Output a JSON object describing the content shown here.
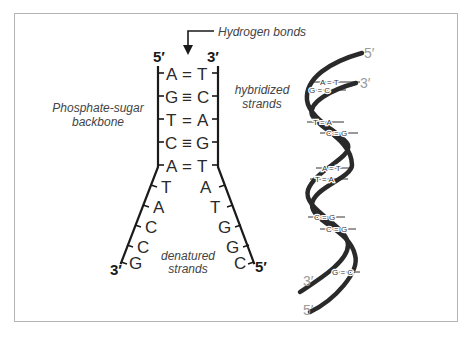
{
  "labels": {
    "hydrogen_bonds": "Hydrogen bonds",
    "hybridized_line1": "hybridized",
    "hybridized_line2": "strands",
    "backbone_line1": "Phosphate-sugar",
    "backbone_line2": "backbone",
    "denatured_line1": "denatured",
    "denatured_line2": "strands"
  },
  "ladder": {
    "top_left_prime": "5′",
    "top_right_prime": "3′",
    "bottom_left_prime": "3′",
    "bottom_right_prime": "5′",
    "hybridized_pairs": [
      {
        "left": "A",
        "bond": "=",
        "right": "T"
      },
      {
        "left": "G",
        "bond": "≡",
        "right": "C"
      },
      {
        "left": "T",
        "bond": "=",
        "right": "A"
      },
      {
        "left": "C",
        "bond": "≡",
        "right": "G"
      },
      {
        "left": "A",
        "bond": "=",
        "right": "T"
      }
    ],
    "denatured_left": [
      "T",
      "A",
      "C",
      "C",
      "G"
    ],
    "denatured_right": [
      "A",
      "T",
      "G",
      "G",
      "C"
    ]
  },
  "helix": {
    "top_5prime": "5′",
    "top_3prime": "3′",
    "bottom_3prime": "3′",
    "bottom_5prime": "5′",
    "pairs": [
      "A = T",
      "G = C",
      "T = A",
      "C = G",
      "A = T",
      "T = A",
      "C = G",
      "C = G",
      "G = C"
    ]
  },
  "colors": {
    "frame": "#b4b4b4",
    "ink": "#1a1a1a",
    "label_gray": "#444444",
    "prime_light": "#9a9a9a"
  }
}
